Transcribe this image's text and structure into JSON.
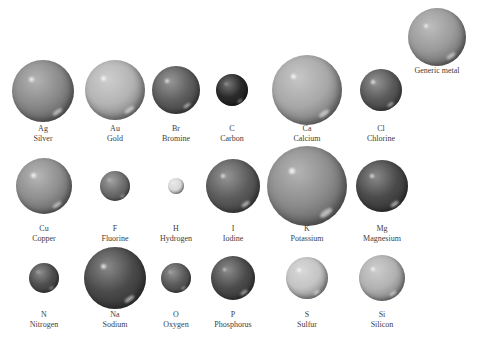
{
  "figure": {
    "reference": {
      "symbol": "",
      "name": "Generic metal",
      "cx": 437,
      "cy": 37,
      "r": 29,
      "shade": "#9a9a9a",
      "label_y": 66
    }
  },
  "atoms": [
    {
      "symbol": "Ag",
      "name": "Silver",
      "cx": 43,
      "cy": 91,
      "r": 31,
      "shade": "#8a8a8a",
      "label_y": 124
    },
    {
      "symbol": "Au",
      "name": "Gold",
      "cx": 115,
      "cy": 90,
      "r": 30,
      "shade": "#b4b4b4",
      "label_y": 124
    },
    {
      "symbol": "Br",
      "name": "Bromine",
      "cx": 176,
      "cy": 90,
      "r": 24,
      "shade": "#5e5e5e",
      "label_y": 124
    },
    {
      "symbol": "C",
      "name": "Carbon",
      "cx": 232,
      "cy": 90,
      "r": 16,
      "shade": "#2a2a2a",
      "label_y": 124
    },
    {
      "symbol": "Ca",
      "name": "Calcium",
      "cx": 307,
      "cy": 90,
      "r": 35,
      "shade": "#a8a8a8",
      "label_y": 124
    },
    {
      "symbol": "Cl",
      "name": "Chlorine",
      "cx": 381,
      "cy": 90,
      "r": 21,
      "shade": "#5a5a5a",
      "label_y": 124
    },
    {
      "symbol": "Cu",
      "name": "Copper",
      "cx": 44,
      "cy": 186,
      "r": 28,
      "shade": "#8e8e8e",
      "label_y": 224
    },
    {
      "symbol": "F",
      "name": "Fluorine",
      "cx": 115,
      "cy": 186,
      "r": 15,
      "shade": "#6e6e6e",
      "label_y": 224
    },
    {
      "symbol": "H",
      "name": "Hydrogen",
      "cx": 176,
      "cy": 186,
      "r": 8,
      "shade": "#dadada",
      "label_y": 224
    },
    {
      "symbol": "I",
      "name": "Iodine",
      "cx": 233,
      "cy": 186,
      "r": 27,
      "shade": "#5c5c5c",
      "label_y": 224
    },
    {
      "symbol": "K",
      "name": "Potassium",
      "cx": 307,
      "cy": 186,
      "r": 40,
      "shade": "#8c8c8c",
      "label_y": 224
    },
    {
      "symbol": "Mg",
      "name": "Magnesium",
      "cx": 382,
      "cy": 186,
      "r": 26,
      "shade": "#4a4a4a",
      "label_y": 224
    },
    {
      "symbol": "N",
      "name": "Nitrogen",
      "cx": 44,
      "cy": 278,
      "r": 15,
      "shade": "#4e4e4e",
      "label_y": 310
    },
    {
      "symbol": "Na",
      "name": "Sodium",
      "cx": 115,
      "cy": 278,
      "r": 31,
      "shade": "#4a4a4a",
      "label_y": 310
    },
    {
      "symbol": "O",
      "name": "Oxygen",
      "cx": 176,
      "cy": 278,
      "r": 15,
      "shade": "#5a5a5a",
      "label_y": 310
    },
    {
      "symbol": "P",
      "name": "Phosphorus",
      "cx": 233,
      "cy": 278,
      "r": 22,
      "shade": "#4c4c4c",
      "label_y": 310
    },
    {
      "symbol": "S",
      "name": "Sulfur",
      "cx": 307,
      "cy": 278,
      "r": 21,
      "shade": "#c4c4c4",
      "label_y": 310
    },
    {
      "symbol": "Si",
      "name": "Silicon",
      "cx": 382,
      "cy": 278,
      "r": 23,
      "shade": "#b2b2b2",
      "label_y": 310
    }
  ]
}
